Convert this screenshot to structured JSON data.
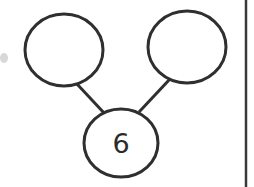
{
  "diagram": {
    "type": "number-bond",
    "whole": "6",
    "parts": [
      "",
      ""
    ],
    "colors": {
      "stroke": "#2f2f2f",
      "background": "#ffffff",
      "smudge": "#d8d8d8"
    }
  }
}
